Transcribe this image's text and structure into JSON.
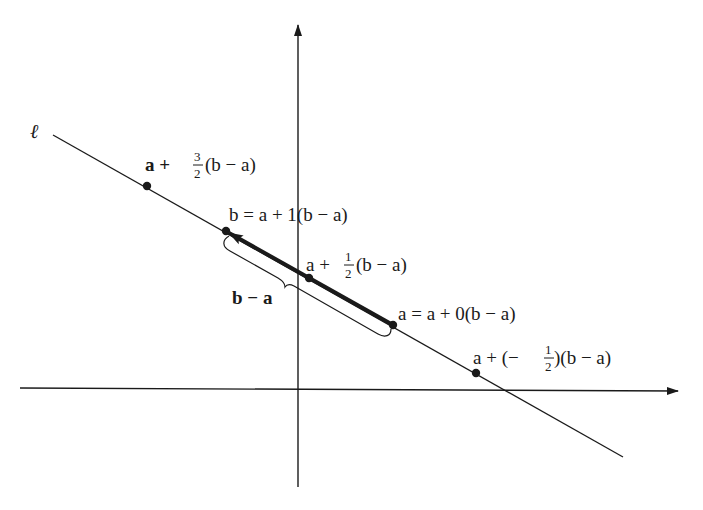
{
  "diagram": {
    "line_label": "ℓ",
    "axes": {
      "x_axis": {
        "from": [
          20,
          388
        ],
        "to": [
          678,
          391
        ]
      },
      "y_axis": {
        "from": [
          298,
          487
        ],
        "to": [
          298,
          25
        ]
      }
    },
    "line": {
      "from": [
        53,
        135
      ],
      "to": [
        623,
        457
      ]
    },
    "vector": {
      "from_label": "a",
      "to_label": "b",
      "from": [
        393,
        325
      ],
      "to": [
        226,
        231
      ]
    },
    "brace_label": "b − a",
    "points": [
      {
        "id": "p_3_2",
        "xy": [
          147,
          186
        ],
        "label": {
          "pre": "a + ",
          "num": "3",
          "den": "2",
          "post": " (b − a)"
        }
      },
      {
        "id": "p_b",
        "xy": [
          226,
          231
        ],
        "label": {
          "pre": "b = a + 1(b − a)"
        }
      },
      {
        "id": "p_1_2",
        "xy": [
          309,
          278
        ],
        "label": {
          "pre": "a + ",
          "num": "1",
          "den": "2",
          "post": " (b − a)"
        }
      },
      {
        "id": "p_a",
        "xy": [
          393,
          325
        ],
        "label": {
          "pre": "a = a + 0(b − a)"
        }
      },
      {
        "id": "p_neg_1_2",
        "xy": [
          476,
          373
        ],
        "label": {
          "pre": "a + (− ",
          "num": "1",
          "den": "2",
          "post": ")(b − a)"
        }
      }
    ],
    "colors": {
      "ink": "#1a1a1a",
      "background": "#ffffff"
    }
  }
}
